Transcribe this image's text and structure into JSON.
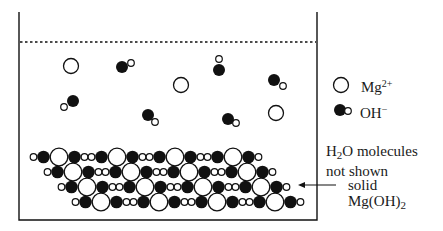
{
  "legend": {
    "mg": {
      "text": "Mg",
      "sup": "2+"
    },
    "oh": {
      "text": "OH",
      "sup": "−"
    }
  },
  "note": {
    "line1_pre": "H",
    "line1_sub": "2",
    "line1_post": "O molecules",
    "line2": "not shown"
  },
  "solid_label": {
    "line1": "solid",
    "line2_pre": "Mg(OH)",
    "line2_sub": "2"
  },
  "beaker": {
    "left": 19,
    "right": 317,
    "top": 12,
    "bottom": 220,
    "surface_y": 42
  },
  "solution_ions": {
    "mg": [
      [
        71,
        66
      ],
      [
        181,
        85
      ],
      [
        276,
        113
      ]
    ],
    "oh": [
      {
        "o": [
          122,
          67
        ],
        "h": [
          131,
          63
        ]
      },
      {
        "o": [
          219,
          70
        ],
        "h": [
          219,
          59
        ]
      },
      {
        "o": [
          274,
          80
        ],
        "h": [
          283,
          86
        ]
      },
      {
        "o": [
          73,
          101
        ],
        "h": [
          64,
          107
        ]
      },
      {
        "o": [
          148,
          115
        ],
        "h": [
          155,
          122
        ]
      },
      {
        "o": [
          228,
          119
        ],
        "h": [
          236,
          123
        ]
      }
    ]
  },
  "lattice": {
    "rows": [
      {
        "y": 157,
        "x0": 30,
        "pattern": "oBMBooBMBooBMBooBMBo"
      },
      {
        "y": 172,
        "x0": 44,
        "pattern": "oBMBooBMBooBMBooBMBo"
      },
      {
        "y": 187,
        "x0": 58,
        "pattern": "oBMBooBMBooBMBooBMBo"
      },
      {
        "y": 202,
        "x0": 72,
        "pattern": "oBMBooBMBooBMBooBMBo"
      }
    ]
  },
  "colors": {
    "ink": "#111111",
    "paper": "#ffffff"
  }
}
